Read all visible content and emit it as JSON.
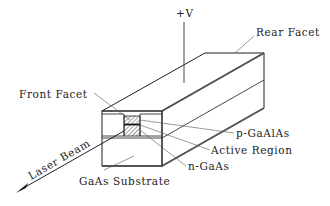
{
  "diagram": {
    "labels": {
      "voltage": "+V",
      "rear_facet": "Rear Facet",
      "front_facet": "Front Facet",
      "p_layer": "p-GaAlAs",
      "active_region": "Active Region",
      "n_layer": "n-GaAs",
      "substrate": "GaAs Substrate",
      "laser_beam": "Laser Beam"
    },
    "colors": {
      "line": "#222222",
      "background": "#ffffff"
    }
  }
}
